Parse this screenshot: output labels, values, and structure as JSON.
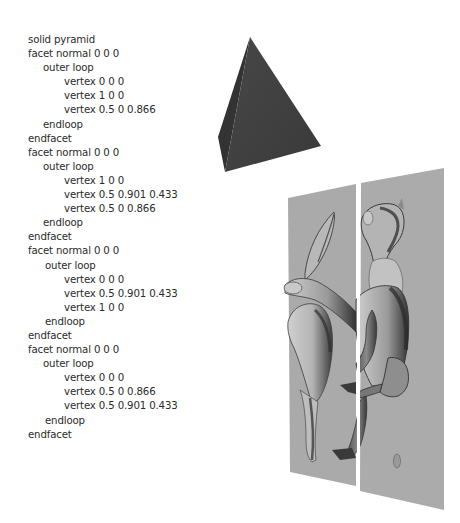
{
  "stl_listing": {
    "lines": [
      {
        "text": "solid pyramid",
        "indent": 0
      },
      {
        "text": "facet normal 0 0 0",
        "indent": 0
      },
      {
        "text": "outer loop",
        "indent": 1
      },
      {
        "text": "vertex 0 0 0",
        "indent": 2
      },
      {
        "text": "vertex 1 0 0",
        "indent": 2
      },
      {
        "text": "vertex 0.5 0 0.866",
        "indent": 2
      },
      {
        "text": "endloop",
        "indent": 1
      },
      {
        "text": "endfacet",
        "indent": 0
      },
      {
        "text": "facet normal 0 0 0",
        "indent": 0
      },
      {
        "text": "outer loop",
        "indent": 1
      },
      {
        "text": "vertex 1 0 0",
        "indent": 2
      },
      {
        "text": "vertex 0.5 0.901 0.433",
        "indent": 2
      },
      {
        "text": "vertex 0.5 0 0.866",
        "indent": 2
      },
      {
        "text": "endloop",
        "indent": 1
      },
      {
        "text": "endfacet",
        "indent": 0
      },
      {
        "text": "facet normal 0 0 0",
        "indent": 0
      },
      {
        "text": "outer loop",
        "indent": 1
      },
      {
        "text": "vertex 0 0 0",
        "indent": 2
      },
      {
        "text": "vertex 0.5 0.901 0.433",
        "indent": 2
      },
      {
        "text": "vertex 1 0 0",
        "indent": 2
      },
      {
        "text": "endloop",
        "indent": 1
      },
      {
        "text": "endfacet",
        "indent": 0
      },
      {
        "text": "facet normal 0 0 0",
        "indent": 0
      },
      {
        "text": "outer loop",
        "indent": 1
      },
      {
        "text": "vertex 0 0 0",
        "indent": 2
      },
      {
        "text": "vertex 0.5 0 0.866",
        "indent": 2
      },
      {
        "text": "vertex 0.5 0.901 0.433",
        "indent": 2
      },
      {
        "text": "endloop",
        "indent": 1
      },
      {
        "text": "endfacet",
        "indent": 0
      }
    ]
  },
  "figures": {
    "pyramid": {
      "label": "pyramid-3d-render",
      "face_color": "#3f3f3f",
      "shadow_color": "#2e2e2e"
    },
    "horse_model": {
      "label": "horse-model-split-between-plates",
      "plate_color": "#a9a9a9",
      "model_light": "#c4c4c4",
      "model_dark": "#3a3a3a"
    }
  }
}
